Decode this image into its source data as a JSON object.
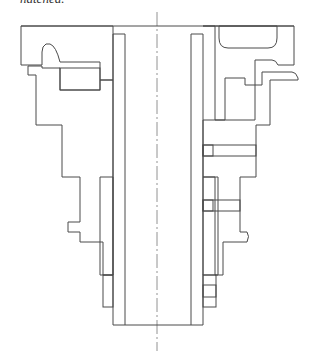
{
  "caption": "hatched.",
  "drawing": {
    "type": "sectional technical drawing",
    "subject": "stepped cylindrical bushing assembly (half-section)",
    "hatch_color": "#6a6a6a",
    "line_color": "#4a4a4a",
    "centerline": "dash-dot vertical axis"
  }
}
